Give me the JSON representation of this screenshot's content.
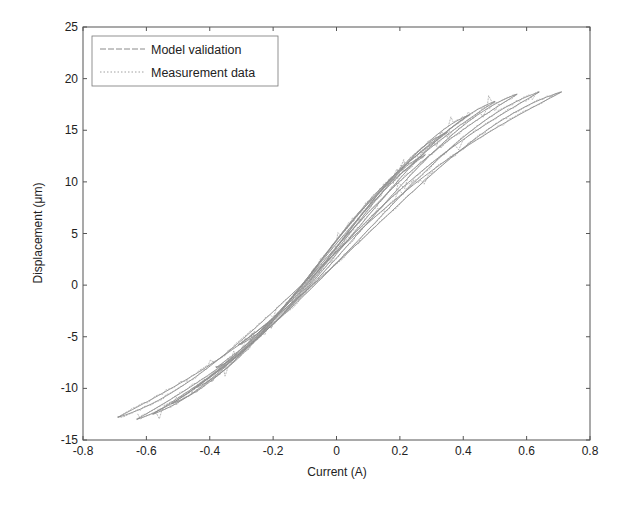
{
  "chart_data": {
    "type": "line",
    "title": "",
    "xlabel": "Current (A)",
    "ylabel": "Displacement (μm)",
    "xlim": [
      -0.8,
      0.8
    ],
    "ylim": [
      -15,
      25
    ],
    "xticks": [
      -0.8,
      -0.6,
      -0.4,
      -0.2,
      0,
      0.2,
      0.4,
      0.6,
      0.8
    ],
    "xtick_labels": [
      "-0.8",
      "-0.6",
      "-0.4",
      "-0.2",
      "0",
      "0.2",
      "0.4",
      "0.6",
      "0.8"
    ],
    "yticks": [
      -15,
      -10,
      -5,
      0,
      5,
      10,
      15,
      20,
      25
    ],
    "ytick_labels": [
      "-15",
      "-10",
      "-5",
      "0",
      "5",
      "10",
      "15",
      "20",
      "25"
    ],
    "grid": false,
    "legend": {
      "placement": "top-left",
      "entries": [
        {
          "label": "Model validation",
          "color": "#8a8a8a",
          "style": "dashed"
        },
        {
          "label": "Measurement data",
          "color": "#a0a0a0",
          "style": "dotted"
        }
      ]
    },
    "series": [
      {
        "name": "Model validation",
        "description": "Nested hysteresis loops (turning points per loop)",
        "loops": [
          {
            "x_min": -0.31,
            "y_min": -5.8,
            "x_max": 0.28,
            "y_max": 12.6
          },
          {
            "x_min": -0.38,
            "y_min": -8.0,
            "x_max": 0.35,
            "y_max": 14.8
          },
          {
            "x_min": -0.45,
            "y_min": -10.0,
            "x_max": 0.42,
            "y_max": 16.5
          },
          {
            "x_min": -0.52,
            "y_min": -11.5,
            "x_max": 0.5,
            "y_max": 17.8
          },
          {
            "x_min": -0.58,
            "y_min": -12.5,
            "x_max": 0.57,
            "y_max": 18.5
          },
          {
            "x_min": -0.63,
            "y_min": -13.0,
            "x_max": 0.64,
            "y_max": 18.7
          },
          {
            "x_min": -0.69,
            "y_min": -12.8,
            "x_max": 0.71,
            "y_max": 18.7
          }
        ]
      },
      {
        "name": "Measurement data",
        "description": "Noisy measured hysteresis loops closely following the model loops",
        "loops": [
          {
            "x_min": -0.31,
            "y_min": -5.8,
            "x_max": 0.28,
            "y_max": 12.6
          },
          {
            "x_min": -0.38,
            "y_min": -8.0,
            "x_max": 0.35,
            "y_max": 14.8
          },
          {
            "x_min": -0.45,
            "y_min": -10.0,
            "x_max": 0.42,
            "y_max": 16.5
          },
          {
            "x_min": -0.52,
            "y_min": -11.5,
            "x_max": 0.5,
            "y_max": 17.8
          },
          {
            "x_min": -0.58,
            "y_min": -12.5,
            "x_max": 0.57,
            "y_max": 18.5
          },
          {
            "x_min": -0.63,
            "y_min": -13.0,
            "x_max": 0.64,
            "y_max": 18.7
          },
          {
            "x_min": -0.69,
            "y_min": -12.8,
            "x_max": 0.71,
            "y_max": 18.7
          }
        ]
      }
    ]
  }
}
